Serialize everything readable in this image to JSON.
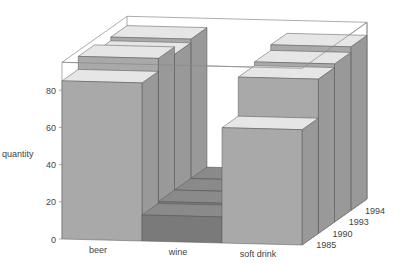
{
  "chart_data": {
    "type": "bar",
    "subtype": "3d-bar",
    "title": "",
    "ylabel": "quantity",
    "xlabel": "",
    "zlabel": "",
    "ylim": [
      0,
      95
    ],
    "yticks": [
      0,
      20,
      40,
      60,
      80
    ],
    "categories": [
      "beer",
      "wine",
      "soft drink"
    ],
    "depth_categories": [
      "1985",
      "1990",
      "1993",
      "1994"
    ],
    "series": [
      {
        "name": "1985",
        "values": [
          85,
          14,
          62
        ]
      },
      {
        "name": "1990",
        "values": [
          92,
          15,
          83
        ]
      },
      {
        "name": "1993",
        "values": [
          88,
          15,
          85
        ]
      },
      {
        "name": "1994",
        "values": [
          90,
          15,
          88
        ]
      }
    ],
    "grid": false,
    "legend": "none"
  },
  "colors": {
    "front_face": "#a9a9a9",
    "top_face": "#e6e6e6",
    "side_face": "#999999",
    "wine_front": "#7a7a7a",
    "wine_top": "#8a8a8a",
    "edge": "#555555",
    "box": "#888888"
  }
}
